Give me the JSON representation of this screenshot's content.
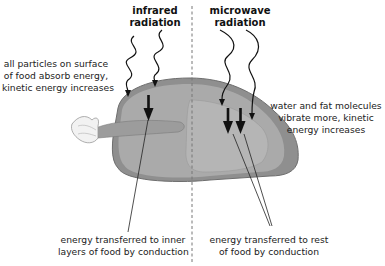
{
  "diagram": {
    "left_panel": {
      "heading_line1": "infrared",
      "heading_line2": "radiation",
      "surface_label_line1": "all particles on surface",
      "surface_label_line2": "of food absorb energy,",
      "surface_label_line3": "kinetic energy increases",
      "conduction_label_line1": "energy transferred to inner",
      "conduction_label_line2": "layers of food by conduction"
    },
    "right_panel": {
      "heading_line1": "microwave",
      "heading_line2": "radiation",
      "molecules_label_line1": "water and fat molecules",
      "molecules_label_line2": "vibrate more, kinetic",
      "molecules_label_line3": "energy increases",
      "conduction_label_line1": "energy transferred to rest",
      "conduction_label_line2": "of food by conduction"
    },
    "colors": {
      "food_body": "#a9a9a9",
      "food_outer_layer": "#8f8f8f",
      "food_inner": "#b8b8b8",
      "arrow": "#111111",
      "divider": "#777777"
    }
  }
}
